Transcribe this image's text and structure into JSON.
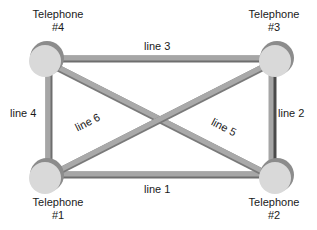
{
  "diagram": {
    "type": "network-topology",
    "topology": "full-mesh",
    "colors": {
      "link_fill": "#a6a6a6",
      "link_edge": "#6e6e6e",
      "node_fill": "#d9d9d9",
      "node_shadow": "#8c8c8c",
      "text": "#1a1a1a"
    },
    "nodes": [
      {
        "id": "t1",
        "label_line1": "Telephone",
        "label_line2": "#1"
      },
      {
        "id": "t2",
        "label_line1": "Telephone",
        "label_line2": "#2"
      },
      {
        "id": "t3",
        "label_line1": "Telephone",
        "label_line2": "#3"
      },
      {
        "id": "t4",
        "label_line1": "Telephone",
        "label_line2": "#4"
      }
    ],
    "links": [
      {
        "id": "line1",
        "label": "line 1",
        "from": "t1",
        "to": "t2"
      },
      {
        "id": "line2",
        "label": "line 2",
        "from": "t2",
        "to": "t3"
      },
      {
        "id": "line3",
        "label": "line 3",
        "from": "t3",
        "to": "t4"
      },
      {
        "id": "line4",
        "label": "line 4",
        "from": "t4",
        "to": "t1"
      },
      {
        "id": "line5",
        "label": "line 5",
        "from": "t4",
        "to": "t2"
      },
      {
        "id": "line6",
        "label": "line 6",
        "from": "t1",
        "to": "t3"
      }
    ]
  }
}
